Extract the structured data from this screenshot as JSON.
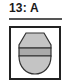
{
  "label": {
    "text": "13: A"
  },
  "figure": {
    "shape": "egg-with-band",
    "colors": {
      "fill": "#c4c4c4",
      "band": "#aaaaaa",
      "outline": "#333333",
      "frame": "#222222"
    }
  }
}
